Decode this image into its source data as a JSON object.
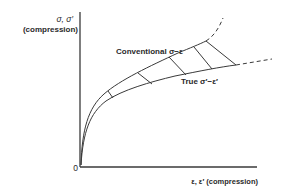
{
  "diagram": {
    "y_axis_label_line1": "σ, σ′",
    "y_axis_label_line2": "(compression)",
    "x_axis_label": "ε, ε′ (compression)",
    "origin_label": "0",
    "curves": [
      {
        "name": "conventional",
        "label": "Conventional σ−ε",
        "style": "solid then dashed, rising steeply"
      },
      {
        "name": "true",
        "label": "True σ′−ε′",
        "style": "solid then dashed, flatter"
      }
    ],
    "tie_line_count": 5,
    "colors": {
      "line": "#3a3a3a",
      "text": "#2a2a2a",
      "background": "#ffffff"
    }
  }
}
